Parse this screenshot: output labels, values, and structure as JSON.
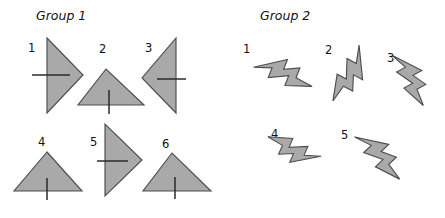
{
  "figure": {
    "background_color": "#ffffff",
    "shape_fill_color": "#a9a9a9",
    "shape_stroke_color": "#4d4d4d",
    "tick_color": "#2b2b2b",
    "text_color": "#111111"
  },
  "groups": [
    {
      "title": "Group 1",
      "title_x": 36,
      "title_y": 20,
      "shape_kind": "triangle",
      "items": [
        {
          "label": "1",
          "label_x": 28,
          "label_y": 52,
          "orientation": "points-right",
          "points": "47,38 47,113 83,75",
          "tick": {
            "x1": 32,
            "y1": 75,
            "x2": 70,
            "y2": 75
          }
        },
        {
          "label": "2",
          "label_x": 99,
          "label_y": 53,
          "orientation": "points-up",
          "points": "106,69 78,105 144,105",
          "tick": {
            "x1": 109,
            "y1": 90,
            "x2": 109,
            "y2": 114
          }
        },
        {
          "label": "3",
          "label_x": 145,
          "label_y": 52,
          "orientation": "points-left",
          "points": "176,38 176,113 142,78",
          "tick": {
            "x1": 157,
            "y1": 79,
            "x2": 186,
            "y2": 79
          }
        },
        {
          "label": "4",
          "label_x": 38,
          "label_y": 146,
          "orientation": "points-up",
          "points": "47,152 14,191 82,191",
          "tick": {
            "x1": 47,
            "y1": 178,
            "x2": 47,
            "y2": 200
          }
        },
        {
          "label": "5",
          "label_x": 90,
          "label_y": 146,
          "orientation": "points-right",
          "points": "105,124 105,196 142,160",
          "tick": {
            "x1": 97,
            "y1": 161,
            "x2": 128,
            "y2": 161
          }
        },
        {
          "label": "6",
          "label_x": 162,
          "label_y": 148,
          "orientation": "points-up",
          "points": "172,153 143,191 211,191",
          "tick": {
            "x1": 175,
            "y1": 177,
            "x2": 175,
            "y2": 199
          }
        }
      ]
    },
    {
      "title": "Group 2",
      "title_x": 260,
      "title_y": 20,
      "shape_kind": "lightning-bolt",
      "items": [
        {
          "label": "1",
          "label_x": 243,
          "label_y": 53,
          "orientation": "pointing-down-right",
          "rotation_deg": 128,
          "center_x": 281,
          "center_y": 71,
          "scale": 1.0
        },
        {
          "label": "2",
          "label_x": 325,
          "label_y": 54,
          "orientation": "pointing-down-left",
          "rotation_deg": 225,
          "center_x": 352,
          "center_y": 72,
          "scale": 1.0
        },
        {
          "label": "3",
          "label_x": 387,
          "label_y": 62,
          "orientation": "pointing-down",
          "rotation_deg": 168,
          "center_x": 410,
          "center_y": 75,
          "scale": 0.96
        },
        {
          "label": "4",
          "label_x": 271,
          "label_y": 138,
          "orientation": "pointing-up-right",
          "rotation_deg": 310,
          "center_x": 296,
          "center_y": 152,
          "scale": 0.92
        },
        {
          "label": "5",
          "label_x": 341,
          "label_y": 139,
          "orientation": "pointing-down-right",
          "rotation_deg": 153,
          "center_x": 378,
          "center_y": 152,
          "scale": 1.0
        }
      ]
    }
  ],
  "bolt_geometry": {
    "path": "M -7,-34 L 9,-12 L -1,-9 L 13,6 L 3,9 L 14,24 L -13,2 L -3,-1 L -14,-13 L -4,-16 Z"
  }
}
